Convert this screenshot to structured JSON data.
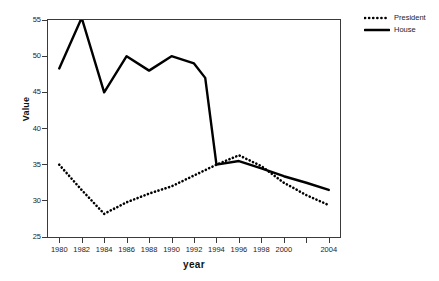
{
  "chart_data": {
    "type": "line",
    "title": "",
    "xlabel": "year",
    "ylabel": "Value",
    "xlim": [
      1979,
      2005
    ],
    "ylim": [
      25,
      55
    ],
    "ytick_values": [
      25,
      30,
      35,
      40,
      45,
      50,
      55
    ],
    "ytick_labels": [
      "25",
      "30",
      "35",
      "40",
      "45",
      "50",
      "55"
    ],
    "xtick_values": [
      1980,
      1982,
      1984,
      1986,
      1988,
      1990,
      1992,
      1994,
      1996,
      1998,
      2000,
      2002,
      2004
    ],
    "xtick_labels": [
      "1980",
      "1982",
      "1984",
      "1986",
      "1988",
      "1990",
      "1992",
      "1994",
      "1996",
      "1998",
      "2000",
      "",
      "2004"
    ],
    "grid": false,
    "legend_position": "right-outside",
    "series": [
      {
        "name": "President",
        "style": "dotted",
        "color": "#000000",
        "x": [
          1980,
          1982,
          1984,
          1986,
          1988,
          1990,
          1992,
          1994,
          1996,
          1998,
          2000,
          2002,
          2004
        ],
        "values": [
          35.0,
          31.5,
          28.2,
          29.8,
          31.0,
          32.0,
          33.5,
          35.0,
          36.3,
          34.8,
          32.5,
          30.8,
          29.4
        ]
      },
      {
        "name": "House",
        "style": "solid",
        "color": "#000000",
        "x": [
          1980,
          1982,
          1984,
          1986,
          1988,
          1990,
          1992,
          1993,
          1994,
          1996,
          1998,
          2000,
          2002,
          2004
        ],
        "values": [
          48.3,
          55.3,
          45.0,
          50.0,
          48.0,
          50.0,
          49.0,
          47.0,
          35.0,
          35.5,
          34.5,
          33.4,
          32.5,
          31.5
        ]
      }
    ]
  },
  "legend": {
    "entries": [
      {
        "label": "President",
        "marker": "dotted-line"
      },
      {
        "label": "House",
        "marker": "solid-line"
      }
    ]
  }
}
